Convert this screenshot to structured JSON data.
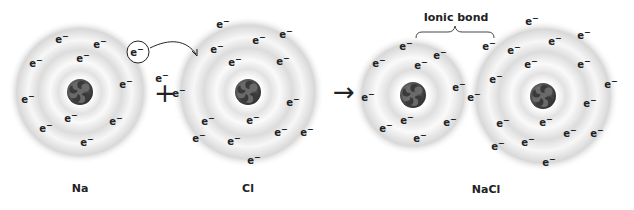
{
  "operators": {
    "plus": "+",
    "arrow": "→"
  },
  "bond_label": "Ionic bond",
  "electron_text": "e",
  "colors": {
    "ring": "#d6d6d6",
    "nucleus": "#555555",
    "text": "#222222"
  },
  "atoms": [
    {
      "id": "na",
      "label": "Na",
      "cx": 80,
      "cy": 92,
      "r": 72,
      "electrons": [
        [
          62,
          43
        ],
        [
          100,
          48
        ],
        [
          36,
          67
        ],
        [
          83,
          62
        ],
        [
          126,
          88
        ],
        [
          28,
          103
        ],
        [
          71,
          122
        ],
        [
          116,
          125
        ],
        [
          46,
          132
        ],
        [
          87,
          146
        ]
      ],
      "label_pos": [
        80,
        190
      ]
    },
    {
      "id": "cl",
      "label": "Cl",
      "cx": 248,
      "cy": 92,
      "r": 76,
      "electrons": [
        [
          223,
          28
        ],
        [
          286,
          38
        ],
        [
          259,
          44
        ],
        [
          217,
          53
        ],
        [
          283,
          65
        ],
        [
          235,
          66
        ],
        [
          162,
          82
        ],
        [
          179,
          97
        ],
        [
          293,
          106
        ],
        [
          208,
          125
        ],
        [
          253,
          124
        ],
        [
          281,
          136
        ],
        [
          199,
          142
        ],
        [
          234,
          145
        ],
        [
          307,
          136
        ],
        [
          254,
          164
        ]
      ],
      "label_pos": [
        248,
        190
      ]
    },
    {
      "id": "na-ion",
      "label": "",
      "cx": 413,
      "cy": 95,
      "r": 60,
      "electrons": [
        [
          406,
          50
        ],
        [
          379,
          67
        ],
        [
          421,
          69
        ],
        [
          440,
          59
        ],
        [
          459,
          91
        ],
        [
          368,
          101
        ],
        [
          407,
          124
        ],
        [
          386,
          132
        ],
        [
          450,
          126
        ],
        [
          420,
          142
        ]
      ],
      "label_pos": null
    },
    {
      "id": "cl-ion",
      "label": "",
      "cx": 543,
      "cy": 96,
      "r": 76,
      "electrons": [
        [
          532,
          25
        ],
        [
          584,
          39
        ],
        [
          555,
          45
        ],
        [
          489,
          50
        ],
        [
          514,
          54
        ],
        [
          531,
          68
        ],
        [
          584,
          68
        ],
        [
          496,
          83
        ],
        [
          611,
          88
        ],
        [
          474,
          101
        ],
        [
          590,
          107
        ],
        [
          503,
          127
        ],
        [
          546,
          126
        ],
        [
          570,
          137
        ],
        [
          597,
          137
        ],
        [
          498,
          150
        ],
        [
          528,
          146
        ],
        [
          549,
          166
        ]
      ],
      "label_pos": null
    }
  ],
  "transfer_electron": {
    "cx": 138,
    "cy": 52,
    "r": 11
  },
  "labels": {
    "na": "Na",
    "cl": "Cl",
    "nacl": "NaCl"
  }
}
